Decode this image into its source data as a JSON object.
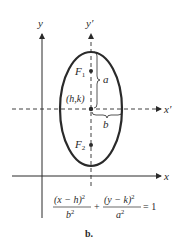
{
  "diagram": {
    "type": "ellipse-vertical-major-axis",
    "axes": {
      "y_label": "y",
      "y_prime_label": "y′",
      "x_label": "x",
      "x_prime_label": "x′"
    },
    "foci": {
      "f1_label": "F",
      "f1_sub": "1",
      "f2_label": "F",
      "f2_sub": "2"
    },
    "center_label": "(h,k)",
    "semi_major_label": "a",
    "semi_minor_label": "b",
    "equation": {
      "term1_num": "(x − h)",
      "term1_num_exp": "2",
      "term1_den": "b",
      "term1_den_exp": "2",
      "plus": "+",
      "term2_num": "(y − k)",
      "term2_num_exp": "2",
      "term2_den": "a",
      "term2_den_exp": "2",
      "equals": "= 1"
    },
    "caption": "b.",
    "colors": {
      "ink": "#2a2a2a",
      "background": "#ffffff"
    }
  }
}
